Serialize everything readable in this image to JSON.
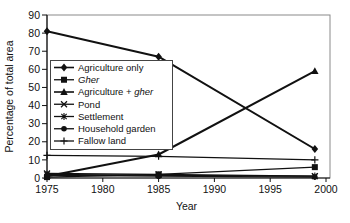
{
  "chart_data": {
    "type": "line",
    "title": "",
    "xlabel": "Year",
    "ylabel": "Percentage of total area",
    "x": [
      1975,
      1985,
      1999
    ],
    "xticks": [
      1975,
      1980,
      1985,
      1990,
      1995,
      2000
    ],
    "xlim": [
      1975,
      2000
    ],
    "ylim": [
      0,
      90
    ],
    "ytick_step": 10,
    "grid": false,
    "legend_position": "inside-upper-left",
    "line_color": "#111111",
    "axis_color": "#111111",
    "border_color": "#8a8a8a",
    "series": [
      {
        "name": "Agriculture only",
        "label_parts": [
          {
            "text": "Agriculture only",
            "italic": false
          }
        ],
        "marker": "diamond",
        "line_width": 2.0,
        "values": [
          81,
          67,
          16
        ]
      },
      {
        "name": "Gher",
        "label_parts": [
          {
            "text": "Gher",
            "italic": true
          }
        ],
        "marker": "square",
        "line_width": 1.3,
        "values": [
          0.5,
          2,
          6
        ]
      },
      {
        "name": "Agriculture + gher",
        "label_parts": [
          {
            "text": "Agriculture + ",
            "italic": false
          },
          {
            "text": "gher",
            "italic": true
          }
        ],
        "marker": "triangle",
        "line_width": 2.0,
        "values": [
          1,
          13,
          59
        ]
      },
      {
        "name": "Pond",
        "label_parts": [
          {
            "text": "Pond",
            "italic": false
          }
        ],
        "marker": "x",
        "line_width": 1.3,
        "values": [
          2.5,
          2,
          1
        ]
      },
      {
        "name": "Settlement",
        "label_parts": [
          {
            "text": "Settlement",
            "italic": false
          }
        ],
        "marker": "asterisk",
        "line_width": 1.3,
        "values": [
          2,
          1.5,
          1
        ]
      },
      {
        "name": "Household garden",
        "label_parts": [
          {
            "text": "Household garden",
            "italic": false
          }
        ],
        "marker": "circle",
        "line_width": 1.3,
        "values": [
          1.5,
          1,
          0.5
        ]
      },
      {
        "name": "Fallow land",
        "label_parts": [
          {
            "text": "Fallow land",
            "italic": false
          }
        ],
        "marker": "plus",
        "line_width": 1.3,
        "values": [
          12.5,
          12,
          10
        ]
      }
    ]
  }
}
